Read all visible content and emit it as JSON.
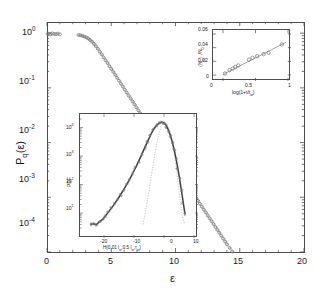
{
  "figure": {
    "kind": "scientific-figure",
    "colors": {
      "axis": "#4d4d4d",
      "marker": "#7a7a7a",
      "curve": "#4d4d4d",
      "gauss": "#9a9a9a"
    }
  },
  "chart_data": [
    {
      "id": "main",
      "type": "scatter",
      "title": "",
      "xlabel": "ε",
      "ylabel": "P (ε)",
      "ylabel_parts": {
        "base": "P",
        "sub": "q",
        "arg": "(ε)"
      },
      "xlim": [
        0,
        20
      ],
      "ylim": [
        0.0001,
        1.6
      ],
      "yscale": "log",
      "xscale": "linear",
      "xticks": [
        0,
        5,
        10,
        15,
        20
      ],
      "xticklabels": [
        "0",
        "5",
        "10",
        "15",
        "20"
      ],
      "yticks": [
        1,
        0.1,
        0.01,
        0.001,
        0.0001
      ],
      "yticklabels": [
        "10⁰",
        "10⁻¹",
        "10⁻²",
        "10⁻³",
        "10⁻⁴"
      ],
      "grid": false,
      "legend": null,
      "marker": "open-circle",
      "x": [
        0.05,
        0.15,
        0.28,
        0.42,
        0.55,
        0.7,
        0.85,
        1.0,
        2.45,
        2.6,
        2.75,
        2.9,
        3.05,
        3.2,
        3.35,
        3.5,
        3.65,
        3.8,
        3.95,
        4.1,
        4.25,
        4.4,
        4.55,
        4.7,
        4.85,
        5.0,
        5.15,
        5.3,
        5.45,
        5.6,
        5.75,
        5.9,
        6.05,
        6.2,
        6.35,
        6.5,
        6.65,
        6.8,
        6.95,
        7.1,
        7.25,
        7.4,
        7.55,
        7.7,
        7.85,
        8.0,
        8.15,
        8.3,
        8.45,
        8.6,
        8.75,
        8.9,
        9.05,
        9.2,
        9.35,
        9.5,
        9.65,
        9.8,
        9.95,
        10.1,
        10.25,
        10.4,
        10.55,
        10.7,
        10.85,
        11.0,
        11.15,
        11.3,
        11.45,
        11.6,
        11.75,
        11.9,
        12.05,
        12.2,
        12.35,
        12.5,
        12.65,
        12.8,
        12.95,
        13.1,
        13.25,
        13.4,
        13.55,
        13.7,
        13.85,
        14.0,
        14.2,
        14.4,
        14.6,
        14.8,
        15.0,
        15.2,
        15.4,
        15.6,
        15.8,
        16.0,
        16.2,
        16.35,
        16.5,
        16.7,
        16.9,
        17.05,
        17.2,
        17.4,
        17.6,
        17.8,
        18.0,
        18.2,
        18.4,
        18.6,
        18.8,
        19.0,
        19.2,
        19.45,
        19.7,
        19.9
      ],
      "y": [
        0.97,
        0.98,
        0.96,
        0.99,
        0.97,
        0.96,
        0.98,
        0.95,
        0.93,
        0.92,
        0.9,
        0.87,
        0.84,
        0.8,
        0.75,
        0.7,
        0.64,
        0.58,
        0.52,
        0.46,
        0.41,
        0.36,
        0.32,
        0.285,
        0.25,
        0.222,
        0.196,
        0.173,
        0.153,
        0.135,
        0.119,
        0.105,
        0.0925,
        0.0818,
        0.0722,
        0.0638,
        0.0564,
        0.0498,
        0.044,
        0.0389,
        0.0344,
        0.0304,
        0.0268,
        0.0237,
        0.021,
        0.0185,
        0.0164,
        0.0145,
        0.0128,
        0.0113,
        0.00999,
        0.00883,
        0.0078,
        0.0069,
        0.0061,
        0.0054,
        0.00477,
        0.00422,
        0.00373,
        0.0033,
        0.00292,
        0.00258,
        0.00228,
        0.00202,
        0.00179,
        0.00158,
        0.0014,
        0.00124,
        0.0011,
        0.00097,
        0.00086,
        0.00076,
        0.00067,
        0.000595,
        0.000527,
        0.000466,
        0.000413,
        0.000366,
        0.000324,
        0.000287,
        0.000254,
        0.000225,
        0.000199,
        0.000176,
        0.000156,
        0.000138,
        0.000118,
        0.000101,
        8.66e-05,
        7.43e-05,
        6.37e-05,
        5.47e-05,
        4.7e-05,
        4.03e-05,
        3.46e-05,
        2.97e-05,
        2.55e-05,
        2.19e-05,
        1.96e-05,
        1.75e-05,
        1.52e-05,
        1.32e-05,
        1.19e-05,
        1.07e-05,
        9.4e-06,
        8.2e-06,
        7.3e-06,
        6.5e-06,
        5.8e-06,
        5.2e-06,
        4.7e-06,
        4.2e-06,
        3.8e-06,
        3.5e-06,
        3.2e-06,
        2.9e-06,
        2.7e-06
      ]
    },
    {
      "id": "inset-top",
      "type": "scatter",
      "title": "",
      "xlabel": "log(1+t/t )",
      "xlabel_parts": {
        "pre": "log(1+t/t",
        "sub": "w",
        "post": ")"
      },
      "ylabel": "〈N 〉/N",
      "ylabel_parts": {
        "pre": "〈N",
        "sub1": "q",
        "mid": "〉/N",
        "sub2": "0"
      },
      "xlim": [
        0,
        1
      ],
      "ylim": [
        0,
        0.06
      ],
      "xscale": "linear",
      "yscale": "linear",
      "xticks": [
        0,
        0.5,
        1
      ],
      "xticklabels": [
        "0",
        "0.5",
        "1"
      ],
      "yticks": [
        0,
        0.02,
        0.04,
        0.06
      ],
      "yticklabels": [
        "0",
        "0.02",
        "0.04",
        "0.06"
      ],
      "grid": false,
      "marker": "open-circle",
      "fit_line": true,
      "x": [
        0.03,
        0.1,
        0.15,
        0.19,
        0.235,
        0.4,
        0.455,
        0.525,
        0.625,
        0.7,
        0.905
      ],
      "y": [
        0.0022,
        0.0072,
        0.0095,
        0.0118,
        0.014,
        0.0225,
        0.0252,
        0.0275,
        0.0305,
        0.0325,
        0.0448
      ]
    },
    {
      "id": "inset-bottom",
      "type": "line",
      "title": "",
      "xlabel": "H(0.01 l ;0.5 l ;τ )",
      "xlabel_parts": {
        "p1": "H(0.01 l",
        "s1": "w",
        "p2": ";0.5 l",
        "s2": "w",
        "p3": ";τ",
        "s3": "w",
        "p4": ")"
      },
      "ylabel": "PDF",
      "xlim": [
        -26,
        10
      ],
      "ylim": [
        3,
        20000
      ],
      "xscale": "linear",
      "yscale": "log",
      "xticks": [
        -20,
        -10,
        0,
        10
      ],
      "xticklabels": [
        "-20",
        "-10",
        "0",
        "10"
      ],
      "yticks": [
        10,
        100,
        1000,
        10000
      ],
      "yticklabels": [
        "10¹",
        "10²",
        "10³",
        "10⁴"
      ],
      "grid": false,
      "marker": "small-dot",
      "series": [
        {
          "name": "measured-pdf",
          "x": [
            -24.5,
            -23.5,
            -22.5,
            -21.5,
            -20.5,
            -19.5,
            -18.5,
            -17.5,
            -16.5,
            -15.5,
            -14.5,
            -13.5,
            -12.5,
            -11.5,
            -10.5,
            -9.5,
            -8.5,
            -7.5,
            -6.5,
            -5.5,
            -4.5,
            -3.5,
            -2.5,
            -1.5,
            -0.8,
            -0.2,
            0.4,
            1.0,
            1.6,
            2.2,
            2.8,
            3.4,
            4.0,
            4.6,
            5.2,
            5.8,
            6.4,
            7.0
          ],
          "y": [
            4,
            4.2,
            4,
            5,
            6,
            8,
            11,
            15,
            21,
            30,
            44,
            65,
            98,
            150,
            240,
            390,
            640,
            1080,
            1900,
            3200,
            5400,
            8600,
            12000,
            14500,
            15500,
            15000,
            13200,
            10500,
            7600,
            5000,
            3000,
            1650,
            830,
            380,
            160,
            62,
            24,
            9
          ]
        },
        {
          "name": "gaussian-reference",
          "style": "dotted",
          "x": [
            -7.0,
            -6.0,
            -5.0,
            -4.0,
            -3.0,
            -2.0,
            -1.0,
            0.0,
            1.0,
            2.0,
            3.0,
            4.0,
            5.0,
            6.0,
            7.0
          ],
          "y": [
            4,
            14,
            60,
            280,
            1300,
            4600,
            11000,
            15500,
            13000,
            6800,
            2200,
            450,
            60,
            8,
            4
          ]
        }
      ]
    }
  ]
}
